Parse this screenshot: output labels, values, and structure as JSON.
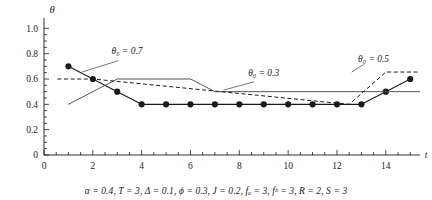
{
  "figure": {
    "caption": "α = 0.4, T = 3, Δ = 0.1, ϕ = 0.3, J = 0.2, fₐ = 3, fᵇ = 3, R = 2, S = 3"
  },
  "chart_data": {
    "type": "line",
    "title": "",
    "xlabel": "t",
    "ylabel": "θ",
    "xlim": [
      0,
      15.4
    ],
    "ylim": [
      0,
      1.05
    ],
    "xticks": [
      0,
      2,
      4,
      6,
      8,
      10,
      12,
      14
    ],
    "xticklabels": [
      "0",
      "2",
      "4",
      "6",
      "8",
      "10",
      "12",
      "14"
    ],
    "xminor_step": 0.5,
    "yticks": [
      0,
      0.2,
      0.4,
      0.6,
      0.8,
      1.0
    ],
    "yticklabels": [
      "0",
      "0.2",
      "0.4",
      "0.6",
      "0.8",
      "1.0"
    ],
    "yminor_step": 0.05,
    "grid": false,
    "legend": "annotations",
    "series": [
      {
        "name": "theta0 = 0.7",
        "label": "θ₀ = 0.7",
        "style": "solid-markers",
        "color": "#1a1a1a",
        "marker": "filled-circle",
        "x": [
          1,
          2,
          3,
          4,
          5,
          6,
          7,
          8,
          9,
          10,
          11,
          12,
          13,
          14,
          15
        ],
        "y": [
          0.7,
          0.6,
          0.5,
          0.4,
          0.4,
          0.4,
          0.4,
          0.4,
          0.4,
          0.4,
          0.4,
          0.4,
          0.4,
          0.5,
          0.6
        ]
      },
      {
        "name": "theta0 = 0.3",
        "label": "θ₀ = 0.3",
        "style": "solid-thin",
        "color": "#555555",
        "marker": "none",
        "x": [
          1,
          3,
          6,
          7,
          15.4
        ],
        "y": [
          0.4,
          0.6,
          0.6,
          0.5,
          0.5
        ]
      },
      {
        "name": "theta0 = 0.5",
        "label": "θ₀ = 0.5",
        "style": "dashed",
        "color": "#1a1a1a",
        "marker": "none",
        "x": [
          0.55,
          2,
          12.5,
          14,
          15.4
        ],
        "y": [
          0.6,
          0.6,
          0.4,
          0.655,
          0.655
        ]
      }
    ],
    "annotations": [
      {
        "name": "label-theta0-07",
        "text": "θ₀ = 0.7",
        "x": 3.4,
        "y": 0.795
      },
      {
        "name": "label-theta0-03",
        "text": "θ₀ = 0.3",
        "x": 9.0,
        "y": 0.625
      },
      {
        "name": "label-theta0-05",
        "text": "θ₀ = 0.5",
        "x": 13.5,
        "y": 0.735
      }
    ]
  }
}
